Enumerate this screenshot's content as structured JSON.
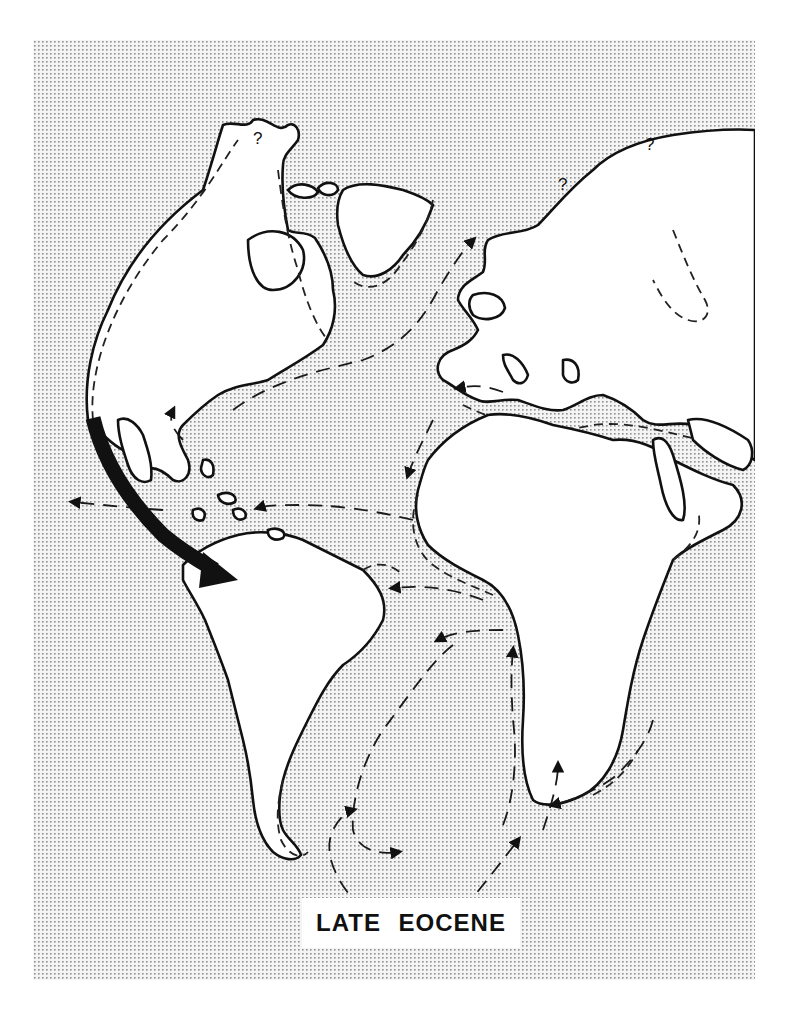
{
  "map": {
    "title": "LATE EOCENE",
    "region": "Atlantic Ocean basin with surrounding continents",
    "question_marks": [
      "?",
      "?",
      "?"
    ],
    "legend_styles": {
      "ocean": "stippled gray",
      "land": "white with solid black coastline",
      "shelf_sea": "dashed outline",
      "surface_current": "dashed line with arrowheads",
      "major_flow": "bold black curved arrow from Pacific into South America"
    },
    "colors": {
      "ocean_dot": "#9a9a9a",
      "ocean_bg": "#f2f2f2",
      "land": "#ffffff",
      "line": "#111111"
    }
  }
}
